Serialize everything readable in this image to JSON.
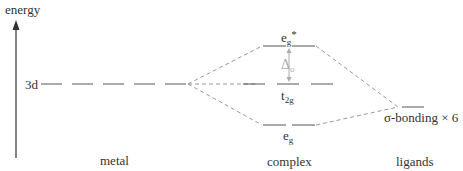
{
  "axis": {
    "label": "energy"
  },
  "levels": {
    "metal_3d": "3d",
    "eg_star_main": "e",
    "eg_star_sub": "g",
    "eg_star_sup": "*",
    "delta_main": "Δ",
    "delta_sub": "o",
    "t2g_main": "t",
    "t2g_sub": "2g",
    "eg_main": "e",
    "eg_sub": "g",
    "ligand": "σ-bonding × 6"
  },
  "columns": {
    "metal": "metal",
    "complex": "complex",
    "ligands": "ligands"
  },
  "colors": {
    "line": "#555555",
    "dashed": "#999999",
    "arrow": "#aaaaaa",
    "text": "#333333"
  }
}
